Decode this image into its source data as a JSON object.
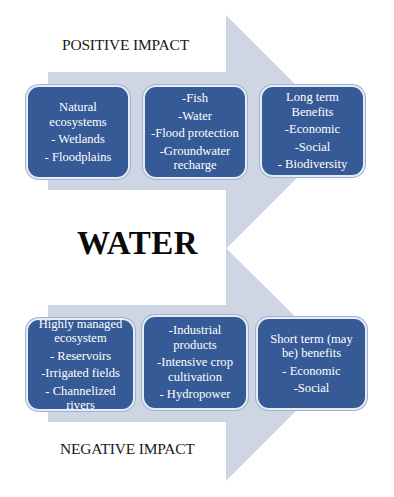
{
  "colors": {
    "arrow": "#ced6e4",
    "box_fill": "#365a95",
    "box_border": "#e6ecf5",
    "box_text": "#ffffff",
    "label_text": "#1a1a1a"
  },
  "center_label": "WATER",
  "positive": {
    "label": "POSITIVE IMPACT",
    "boxes": [
      {
        "lines": [
          "Natural",
          "ecosystems",
          "- Wetlands",
          "- Floodplains"
        ]
      },
      {
        "lines": [
          "-Fish",
          "-Water",
          "-Flood protection",
          "-Groundwater",
          "recharge"
        ]
      },
      {
        "lines": [
          "Long term",
          "Benefits",
          "-Economic",
          "-Social",
          "- Biodiversity"
        ]
      }
    ]
  },
  "negative": {
    "label": "NEGATIVE IMPACT",
    "boxes": [
      {
        "lines": [
          "Highly managed",
          "ecosystem",
          "- Reservoirs",
          "-Irrigated fields",
          "- Channelized rivers"
        ]
      },
      {
        "lines": [
          "-Industrial",
          "products",
          "-Intensive crop",
          "cultivation",
          "- Hydropower"
        ]
      },
      {
        "lines": [
          "Short term (may",
          "be) benefits",
          "- Economic",
          "-Social"
        ]
      }
    ]
  }
}
